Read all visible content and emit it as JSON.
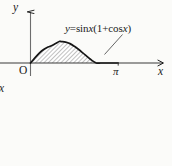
{
  "figure": {
    "background_color": "#fbfbf9",
    "ink_color": "#1a1a1a",
    "shading_color": "#9a9a9a",
    "axes": {
      "y_axis_label": "y",
      "x_axis_label": "x",
      "origin_label": "O",
      "x_tick_label": "π"
    },
    "annotation": {
      "equation_full": "y=sin x(1+cos x)",
      "equation_lhs": "y",
      "equation_equals": "=",
      "equation_sin": "sin",
      "equation_var1": "x",
      "equation_open": "(1+",
      "equation_cos": "cos",
      "equation_var2": "x",
      "equation_close": ")"
    },
    "stray_text": "x"
  },
  "chart_data": {
    "type": "area",
    "title": "",
    "subtitle": "",
    "xlabel": "x",
    "ylabel": "y",
    "function": "y = sin x (1 + cos x)",
    "annotations": [
      "y=sin x(1+cos x)"
    ],
    "legend": [],
    "legend_position": "none",
    "grid": false,
    "xlim": [
      0,
      4.35
    ],
    "ylim": [
      0,
      1.55
    ],
    "x_ticks": [
      0,
      3.14159
    ],
    "x_tick_labels": [
      "O",
      "π"
    ],
    "y_ticks": [],
    "y_tick_labels": [],
    "shaded_region": {
      "from_x": 0,
      "to_x": 3.14159,
      "fill": "hatch",
      "label": "area under curve"
    },
    "peak": {
      "x": 1.0472,
      "y": 1.299
    },
    "x": [
      0,
      0.1571,
      0.3142,
      0.4712,
      0.6283,
      0.7854,
      0.9425,
      1.0472,
      1.0996,
      1.2566,
      1.4137,
      1.5708,
      1.7279,
      1.885,
      2.042,
      2.1991,
      2.3562,
      2.5133,
      2.6704,
      2.8274,
      2.9845,
      3.14159
    ],
    "y": [
      0,
      0.3095,
      0.5878,
      0.8078,
      0.9511,
      1.0607,
      1.2124,
      1.299,
      1.2817,
      1.25,
      1.1588,
      1.0,
      0.809,
      0.5878,
      0.3633,
      0.1545,
      0.0,
      -0.0782,
      -0.1123,
      -0.1045,
      -0.0598,
      0
    ]
  }
}
